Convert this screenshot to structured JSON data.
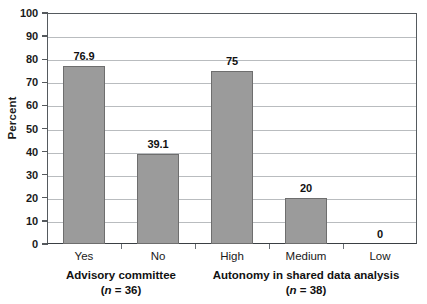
{
  "chart_data": {
    "type": "bar",
    "title": "",
    "subtitle": "",
    "xlabel": "",
    "ylabel": "Percent",
    "ylim": [
      0,
      100
    ],
    "ytick_step": 10,
    "yticks": [
      "0",
      "10",
      "20",
      "30",
      "40",
      "50",
      "60",
      "70",
      "80",
      "90",
      "100"
    ],
    "grid": true,
    "legend": "none",
    "categories": [
      "Yes",
      "No",
      "High",
      "Medium",
      "Low"
    ],
    "values": [
      76.9,
      39.1,
      75,
      20,
      0
    ],
    "value_labels": [
      "76.9",
      "39.1",
      "75",
      "20",
      "0"
    ],
    "bar_color": "#9b9b9b",
    "bar_border_color": "#6e6e6e",
    "gridline_color": "#b9bcbf",
    "axis_color": "#555a5e",
    "groups": [
      {
        "label": "Advisory committee",
        "n_label": "(n = 38)",
        "n_prefix": "(",
        "n_italic": "n",
        "n_suffix": " = 36)",
        "categories": [
          "Yes",
          "No"
        ]
      },
      {
        "label": "Autonomy in shared data analysis",
        "n_label": "(n = 38)",
        "n_prefix": "(",
        "n_italic": "n",
        "n_suffix": " = 38)",
        "categories": [
          "High",
          "Medium",
          "Low"
        ]
      }
    ]
  }
}
